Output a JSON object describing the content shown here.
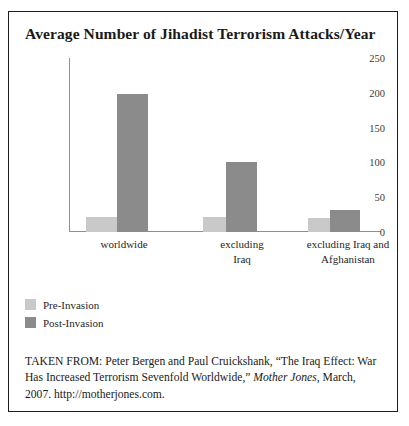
{
  "figure": {
    "title": "Average Number of Jihadist Terrorism Attacks/Year",
    "source_prefix": "TAKEN FROM: Peter Bergen and Paul Cruickshank, “The Iraq Effect: War Has Increased Terrorism Sevenfold Worldwide,” ",
    "source_italic": "Mother Jones",
    "source_suffix": ", March, 2007. http://motherjones.com."
  },
  "colors": {
    "pre_invasion": "#c9c9c9",
    "post_invasion": "#8b8b8b",
    "frame": "#1c1c1c",
    "axis": "#8f8f8f"
  },
  "legend": {
    "items": [
      {
        "label": "Pre-Invasion",
        "color": "#c9c9c9"
      },
      {
        "label": "Post-Invasion",
        "color": "#8b8b8b"
      }
    ]
  },
  "chart_data": {
    "type": "bar",
    "title": "Average Number of Jihadist Terrorism Attacks/Year",
    "xlabel": "",
    "ylabel": "",
    "categories": [
      "worldwide",
      "excluding Iraq",
      "excluding Iraq and Afghanistan"
    ],
    "category_lines": [
      [
        "worldwide"
      ],
      [
        "excluding",
        "Iraq"
      ],
      [
        "excluding Iraq and",
        "Afghanistan"
      ]
    ],
    "series": [
      {
        "name": "Pre-Invasion",
        "color": "#c9c9c9",
        "values": [
          22,
          21,
          20
        ]
      },
      {
        "name": "Post-Invasion",
        "color": "#8b8b8b",
        "values": [
          198,
          100,
          32
        ]
      }
    ],
    "ylim": [
      0,
      250
    ],
    "yticks": [
      250,
      200,
      150,
      100,
      50,
      0
    ],
    "grid": false,
    "legend_position": "bottom-left"
  }
}
